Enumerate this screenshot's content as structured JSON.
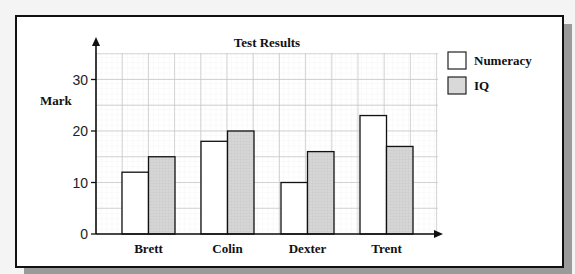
{
  "chart_data": {
    "type": "bar",
    "title": "Test Results",
    "xlabel": "",
    "ylabel": "Mark",
    "categories": [
      "Brett",
      "Colin",
      "Dexter",
      "Trent"
    ],
    "series": [
      {
        "name": "Numeracy",
        "values": [
          12,
          18,
          10,
          23
        ],
        "color": "#ffffff"
      },
      {
        "name": "IQ",
        "values": [
          15,
          20,
          16,
          17
        ],
        "color": "#d9d9d9"
      }
    ],
    "ylim": [
      0,
      35
    ],
    "yticks": [
      0,
      10,
      20,
      30
    ],
    "grid": true,
    "legend_position": "right"
  }
}
